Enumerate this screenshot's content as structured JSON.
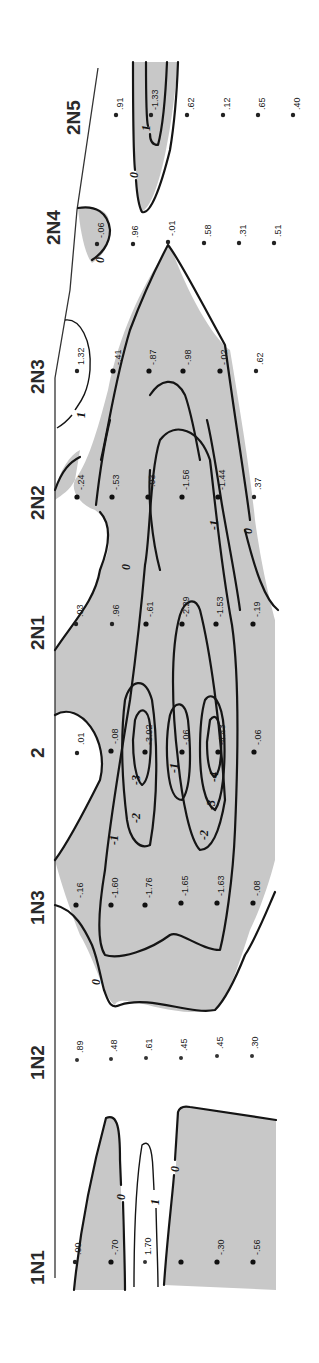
{
  "figure": {
    "type": "contour cross-section (rotated 90°)",
    "shading": {
      "negative_region_color": "#c8c8c8",
      "background": "#ffffff",
      "line_color": "#151515"
    },
    "stations": [
      {
        "id": "2N5",
        "label": "2N5",
        "values": [
          ".91",
          "-1.33",
          ".62",
          ".12",
          ".65",
          ".40"
        ]
      },
      {
        "id": "2N4",
        "label": "2N4",
        "values": [
          "-.06",
          ".96",
          "-.01",
          ".58",
          ".31",
          ".51"
        ]
      },
      {
        "id": "2N3",
        "label": "2N3",
        "values": [
          "1.32",
          "-.41",
          "-.87",
          "-.98",
          "-.02",
          ".62"
        ]
      },
      {
        "id": "2N2",
        "label": "2N2",
        "values": [
          "-.24",
          "-.53",
          "-.03",
          "-1.56",
          "-1.44",
          ".37"
        ]
      },
      {
        "id": "2N1",
        "label": "2N1",
        "values": [
          ".03",
          ".96",
          "-.61",
          "-2.29",
          "-1.53",
          "-.19"
        ]
      },
      {
        "id": "2",
        "label": "2",
        "values": [
          ".01",
          "-.08",
          "-3.02",
          "-.06",
          "-4.43",
          "-.06"
        ]
      },
      {
        "id": "1N3",
        "label": "1N3",
        "values": [
          "-.16",
          "-1.60",
          "-1.76",
          "-1.65",
          "-1.63",
          "-.08"
        ]
      },
      {
        "id": "1N2",
        "label": "1N2",
        "values": [
          ".89",
          ".48",
          ".61",
          ".45",
          ".45",
          ".30"
        ]
      },
      {
        "id": "1N1",
        "label": "1N1",
        "values": [
          ".00",
          "-.70",
          "1.70",
          "",
          "-.30",
          "-.56"
        ]
      }
    ],
    "contour_levels": [
      "1",
      "0",
      "-1",
      "-2",
      "-3",
      "-4"
    ],
    "contour_labels": [
      {
        "text": "0",
        "near": "2N5"
      },
      {
        "text": "1",
        "near": "2N5"
      },
      {
        "text": "0",
        "near": "2N4"
      },
      {
        "text": "1",
        "near": "2N3"
      },
      {
        "text": "0",
        "near": "2N1"
      },
      {
        "text": "0",
        "near": "2N2-bottom"
      },
      {
        "text": "-1",
        "near": "2N2"
      },
      {
        "text": "-1",
        "near": "1N3"
      },
      {
        "text": "-2",
        "near": "2-upper"
      },
      {
        "text": "-3",
        "near": "2-upper"
      },
      {
        "text": "-1",
        "near": "2-middle"
      },
      {
        "text": "-4",
        "near": "2-lower"
      },
      {
        "text": "-3",
        "near": "2-lower"
      },
      {
        "text": "-2",
        "near": "2-lower"
      },
      {
        "text": "0",
        "near": "1N2-1N3"
      },
      {
        "text": "0",
        "near": "1N1-upper"
      },
      {
        "text": "1",
        "near": "1N1"
      },
      {
        "text": "0",
        "near": "1N1-lower"
      }
    ]
  }
}
